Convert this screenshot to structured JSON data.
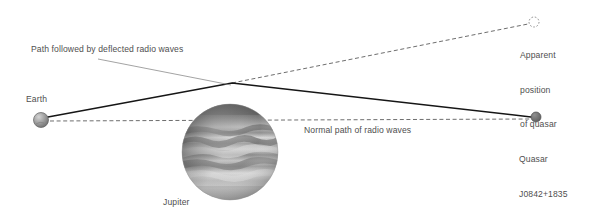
{
  "diagram": {
    "background_color": "#ffffff",
    "text_color": "#4f4f4f",
    "line_color": "#1a1a1a",
    "dashed_color": "#6e6e6e"
  },
  "labels": {
    "deflected_path": "Path followed by deflected radio waves",
    "normal_path": "Normal path of radio waves",
    "earth": "Earth",
    "jupiter": "Jupiter",
    "apparent_position": "Apparent\nposition\nof quasar",
    "apparent_position_line1": "Apparent",
    "apparent_position_line2": "position",
    "apparent_position_line3": "of quasar",
    "quasar_name": "Quasar",
    "quasar_designation": "J0842+1835",
    "quasar": "Quasar\nJ0842+1835"
  },
  "bodies": {
    "earth": {
      "name": "Earth",
      "cx": 41,
      "cy": 120,
      "r": 7.5,
      "fill": "#8e8e8e"
    },
    "jupiter": {
      "name": "Jupiter",
      "cx": 230,
      "cy": 152,
      "r": 48,
      "fill": "#9a9a9a"
    },
    "quasar": {
      "name": "Quasar J0842+1835",
      "cx": 536,
      "cy": 117,
      "r": 5,
      "fill": "#6a6a6a"
    },
    "apparent_quasar": {
      "name": "Apparent position of quasar",
      "cx": 534,
      "cy": 22,
      "r": 5,
      "stroke": "#8a8a8a"
    }
  },
  "paths": {
    "deflected": {
      "style": "solid",
      "points": "48,117 232,83 531,117"
    },
    "normal": {
      "style": "dashed",
      "points": "50,121 531,119"
    },
    "sightline": {
      "style": "dashed",
      "points": "232,83 528,24"
    },
    "leader": {
      "style": "thin",
      "points": "98,59 230,85"
    }
  }
}
